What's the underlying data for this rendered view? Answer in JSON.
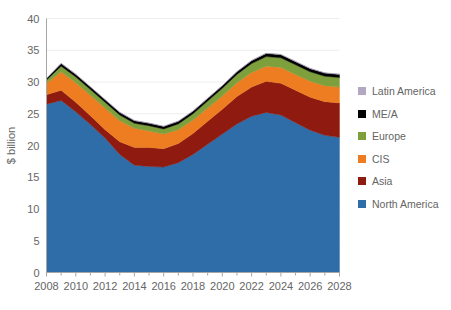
{
  "chart_data": {
    "type": "area",
    "title": "",
    "xlabel": "",
    "ylabel": "$ billion",
    "stacked": true,
    "grid": true,
    "legend_position": "right",
    "xlim": [
      2008,
      2028
    ],
    "ylim": [
      0,
      40
    ],
    "y_ticks": [
      0,
      5,
      10,
      15,
      20,
      25,
      30,
      35,
      40
    ],
    "x_ticks": [
      2008,
      2010,
      2012,
      2014,
      2016,
      2018,
      2020,
      2022,
      2024,
      2026,
      2028
    ],
    "x_minor_tick_step": 1,
    "x": [
      2008,
      2009,
      2010,
      2011,
      2012,
      2013,
      2014,
      2015,
      2016,
      2017,
      2018,
      2019,
      2020,
      2021,
      2022,
      2023,
      2024,
      2025,
      2026,
      2027,
      2028
    ],
    "series": [
      {
        "name": "North America",
        "color": "#2E6DA8",
        "values": [
          26.5,
          27.1,
          25.3,
          23.3,
          21.2,
          18.6,
          16.9,
          16.7,
          16.6,
          17.3,
          18.6,
          20.2,
          21.8,
          23.4,
          24.6,
          25.2,
          24.8,
          23.6,
          22.4,
          21.6,
          21.3
        ]
      },
      {
        "name": "Asia",
        "color": "#8E1A10",
        "values": [
          1.5,
          1.6,
          1.5,
          1.4,
          1.3,
          2.0,
          2.8,
          3.0,
          2.9,
          3.0,
          3.3,
          3.6,
          3.9,
          4.3,
          4.6,
          4.9,
          5.0,
          5.1,
          5.2,
          5.3,
          5.4
        ]
      },
      {
        "name": "CIS",
        "color": "#ED7D20",
        "values": [
          1.8,
          2.9,
          3.1,
          3.2,
          3.4,
          3.3,
          3.0,
          2.6,
          2.3,
          2.2,
          2.1,
          2.1,
          2.1,
          2.2,
          2.3,
          2.4,
          2.5,
          2.5,
          2.5,
          2.5,
          2.5
        ]
      },
      {
        "name": "Europe",
        "color": "#7EA03C",
        "values": [
          0.5,
          0.9,
          0.9,
          0.9,
          0.9,
          0.9,
          0.8,
          0.8,
          0.8,
          0.9,
          1.0,
          1.1,
          1.2,
          1.3,
          1.4,
          1.5,
          1.5,
          1.5,
          1.5,
          1.5,
          1.5
        ]
      },
      {
        "name": "ME/A",
        "color": "#000000",
        "values": [
          0.25,
          0.4,
          0.4,
          0.4,
          0.4,
          0.4,
          0.4,
          0.4,
          0.4,
          0.4,
          0.4,
          0.4,
          0.4,
          0.4,
          0.45,
          0.5,
          0.5,
          0.5,
          0.5,
          0.5,
          0.5
        ]
      },
      {
        "name": "Latin America",
        "color": "#B3A8C4",
        "values": [
          0.05,
          0.05,
          0.05,
          0.05,
          0.05,
          0.05,
          0.05,
          0.05,
          0.05,
          0.05,
          0.05,
          0.05,
          0.05,
          0.05,
          0.05,
          0.05,
          0.05,
          0.05,
          0.05,
          0.05,
          0.05
        ]
      }
    ],
    "totals": [
      30.6,
      32.95,
      31.25,
      29.25,
      27.25,
      25.25,
      23.95,
      23.55,
      23.05,
      23.85,
      25.45,
      27.45,
      29.45,
      31.65,
      33.4,
      34.55,
      34.35,
      33.25,
      32.15,
      31.45,
      31.25
    ]
  },
  "legend": {
    "items": [
      {
        "label": "Latin America",
        "color": "#B3A8C4"
      },
      {
        "label": "ME/A",
        "color": "#000000"
      },
      {
        "label": "Europe",
        "color": "#7EA03C"
      },
      {
        "label": "CIS",
        "color": "#ED7D20"
      },
      {
        "label": "Asia",
        "color": "#8E1A10"
      },
      {
        "label": "North America",
        "color": "#2E6DA8"
      }
    ]
  },
  "axes": {
    "y_title": "$ billion",
    "y_tick_labels": [
      "0",
      "5",
      "10",
      "15",
      "20",
      "25",
      "30",
      "35",
      "40"
    ],
    "x_tick_labels": [
      "2008",
      "2010",
      "2012",
      "2014",
      "2016",
      "2018",
      "2020",
      "2022",
      "2024",
      "2026",
      "2028"
    ]
  },
  "style": {
    "grid_color": "#EDEDED",
    "axis_color": "#A6A6A6",
    "text_color": "#666666",
    "background": "#FFFFFF"
  }
}
